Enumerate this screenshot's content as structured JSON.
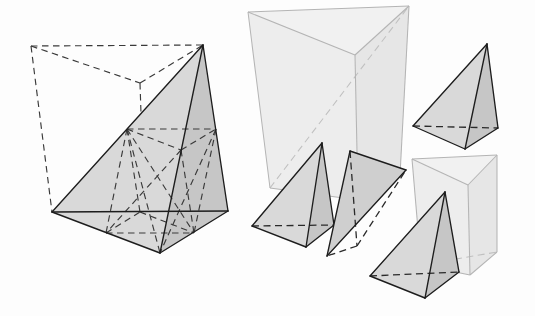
{
  "figure": {
    "canvas": {
      "width": 535,
      "height": 316,
      "background": "#fdfdfd"
    },
    "palette": {
      "solid_face_light": "#d9d9d9",
      "solid_face_mid": "#cfcfcf",
      "solid_face_dark": "#c6c6c6",
      "ghost_face_a": "#ededed",
      "ghost_face_b": "#e6e6e6",
      "ghost_face_c": "#f1f1f1",
      "visible_edge": "#1d1d1d",
      "hidden_edge": "#2a2a2a",
      "ghost_edge": "#b4b4b4",
      "construction_edge": "#3a3a3a"
    },
    "line_styles": {
      "visible": "solid",
      "hidden": "dashed",
      "construction": "dashed"
    }
  },
  "shapes": {
    "main_tetrahedron": {
      "name": "large shaded tetrahedron",
      "vertices": {
        "apex": [
          203,
          45
        ],
        "base_left": [
          52,
          212
        ],
        "base_right": [
          228,
          211
        ],
        "base_front": [
          160,
          253
        ]
      },
      "faces": {
        "left_face": "52,212 203,45 160,253",
        "right_face": "203,45 228,211 160,253"
      },
      "visible_edges": [
        "52,212 203,45",
        "203,45 228,211",
        "52,212 228,211",
        "52,212 160,253",
        "160,253 228,211",
        "203,45 160,253"
      ]
    },
    "enclosing_prism_construction": {
      "name": "dashed enclosing prism around large tetrahedron",
      "vertices": {
        "top_back_left": [
          31,
          46
        ],
        "top_back_mid": [
          140,
          83
        ],
        "top_front_right": [
          203,
          45
        ],
        "bottom_back_left": [
          52,
          212
        ],
        "bottom_back_mid": [
          145,
          234
        ],
        "bottom_front_right": [
          228,
          211
        ]
      },
      "dashed_edges": [
        "31,46 203,45",
        "31,46 140,83",
        "140,83 203,45",
        "31,46 52,212",
        "140,83 145,234",
        "52,212 145,234",
        "145,234 228,211"
      ]
    },
    "midpoint_subdivision": {
      "name": "interior dashed midpoint construction lines",
      "midpoints": {
        "m_left_apex": [
          127,
          129
        ],
        "m_right_apex": [
          216,
          129
        ],
        "m_front_apex": [
          181,
          150
        ],
        "m_base_left_front": [
          106,
          233
        ],
        "m_base_left_right": [
          140,
          212
        ],
        "m_base_front_right": [
          194,
          233
        ]
      },
      "dashed_edges": [
        "127,129 216,129",
        "127,129 181,150",
        "181,150 216,129",
        "127,129 106,233",
        "127,129 140,212",
        "127,129 194,233",
        "181,150 106,233",
        "216,129 194,233",
        "181,150 194,233",
        "106,233 140,212",
        "106,233 194,233",
        "140,212 194,233",
        "127,129 160,253",
        "216,129 160,253"
      ]
    },
    "ghost_prism_large": {
      "name": "large translucent prism upper-middle",
      "vertices": {
        "top_left": [
          248,
          12
        ],
        "top_right": [
          409,
          6
        ],
        "top_mid": [
          355,
          55
        ],
        "bottom_left": [
          270,
          188
        ],
        "bottom_right": [
          400,
          175
        ],
        "bottom_mid": [
          358,
          200
        ]
      },
      "faces": {
        "left_face": "248,12 355,55 358,200 270,188",
        "right_face": "355,55 409,6 400,175 358,200",
        "top_face": "248,12 409,6 355,55"
      },
      "visible_edges": [
        "248,12 409,6",
        "248,12 355,55",
        "355,55 409,6",
        "248,12 270,188",
        "355,55 358,200",
        "409,6 400,175",
        "270,188 358,200",
        "358,200 400,175"
      ],
      "hidden_edges": [
        "270,188 409,6"
      ]
    },
    "ghost_prism_right": {
      "name": "small translucent prism lower-right",
      "vertices": {
        "top_left": [
          412,
          159
        ],
        "top_right": [
          497,
          155
        ],
        "top_mid": [
          468,
          185
        ],
        "bottom_left": [
          421,
          265
        ],
        "bottom_right": [
          497,
          252
        ],
        "bottom_mid": [
          470,
          275
        ]
      },
      "faces": {
        "left_face": "412,159 468,185 470,275 421,265",
        "right_face": "468,185 497,155 497,252 470,275",
        "top_face": "412,159 497,155 468,185"
      },
      "visible_edges": [
        "412,159 497,155",
        "412,159 468,185",
        "468,185 497,155",
        "412,159 421,265",
        "468,185 470,275",
        "497,155 497,252",
        "421,265 470,275",
        "470,275 497,252"
      ],
      "hidden_edges": [
        "421,265 497,252"
      ]
    },
    "tetra_top_right": {
      "name": "shaded tetrahedron upper right",
      "vertices": {
        "apex": [
          487,
          44
        ],
        "base_left": [
          413,
          126
        ],
        "base_right": [
          498,
          128
        ],
        "base_front": [
          465,
          149
        ]
      },
      "faces": {
        "left_face": "413,126 487,44 465,149",
        "right_face": "487,44 498,128 465,149"
      },
      "visible_edges": [
        "413,126 487,44",
        "487,44 498,128",
        "413,126 465,149",
        "465,149 498,128",
        "487,44 465,149"
      ],
      "hidden_edges": [
        "413,126 498,128"
      ]
    },
    "tetra_mid_left": {
      "name": "shaded tetrahedron middle left",
      "vertices": {
        "apex": [
          322,
          143
        ],
        "base_left": [
          252,
          226
        ],
        "base_right": [
          334,
          225
        ],
        "base_front": [
          306,
          247
        ]
      },
      "faces": {
        "left_face": "252,226 322,143 306,247",
        "right_face": "322,143 334,225 306,247"
      },
      "visible_edges": [
        "252,226 322,143",
        "322,143 334,225",
        "252,226 306,247",
        "306,247 334,225",
        "322,143 306,247"
      ],
      "hidden_edges": [
        "252,226 334,225"
      ]
    },
    "tetra_mid_center": {
      "name": "shaded tetrahedron middle center",
      "vertices": {
        "apex": [
          350,
          151
        ],
        "right": [
          406,
          170
        ],
        "base_front_left": [
          327,
          256
        ],
        "base_back": [
          357,
          246
        ]
      },
      "faces": {
        "left_face": "350,151 327,256 357,246",
        "right_face": "350,151 406,170 327,256"
      },
      "visible_edges": [
        "350,151 406,170",
        "350,151 327,256",
        "406,170 327,256",
        "327,256 406,170"
      ],
      "hidden_edges": [
        "350,151 357,246",
        "357,246 327,256",
        "357,246 406,170"
      ]
    },
    "tetra_bottom": {
      "name": "shaded tetrahedron bottom",
      "vertices": {
        "apex": [
          445,
          192
        ],
        "base_left": [
          370,
          276
        ],
        "base_right": [
          459,
          272
        ],
        "base_front": [
          425,
          298
        ]
      },
      "faces": {
        "left_face": "370,276 445,192 425,298",
        "right_face": "445,192 459,272 425,298"
      },
      "visible_edges": [
        "370,276 445,192",
        "445,192 459,272",
        "370,276 425,298",
        "425,298 459,272",
        "445,192 425,298"
      ],
      "hidden_edges": [
        "370,276 459,272"
      ]
    }
  },
  "legend": {
    "solid_line_meaning": "visible edge",
    "dashed_line_meaning": "hidden or construction edge"
  }
}
